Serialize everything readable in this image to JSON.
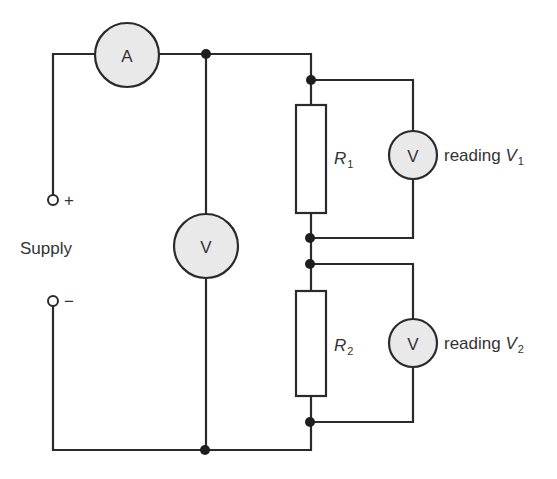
{
  "diagram": {
    "type": "circuit-schematic",
    "title": "",
    "supply": {
      "label": "Supply",
      "positive_symbol": "+",
      "negative_symbol": "−"
    },
    "ammeter": {
      "label": "A"
    },
    "voltmeter_supply": {
      "label": "V"
    },
    "resistors": [
      {
        "symbol": "R",
        "subscript": "1"
      },
      {
        "symbol": "R",
        "subscript": "2"
      }
    ],
    "voltmeters": [
      {
        "label": "V",
        "reading_text": "reading ",
        "reading_symbol": "V",
        "reading_subscript": "1"
      },
      {
        "label": "V",
        "reading_text": "reading ",
        "reading_symbol": "V",
        "reading_subscript": "2"
      }
    ],
    "colors": {
      "wire": "#2a2a2a",
      "meter_fill": "#e9e9e9",
      "background": "#ffffff"
    }
  }
}
